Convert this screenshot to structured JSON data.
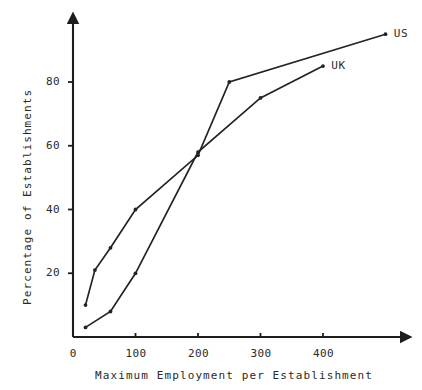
{
  "chart_data": {
    "type": "line",
    "title": "",
    "xlabel": "Maximum Employment per Establishment",
    "ylabel": "Percentage of Establishments",
    "xlim": [
      0,
      500
    ],
    "ylim": [
      0,
      95
    ],
    "grid": false,
    "legend_position": "inline-right-end-of-line",
    "xticks": [
      0,
      100,
      200,
      300,
      400
    ],
    "xtick_labels": [
      "0",
      "100",
      "200",
      "300",
      "400"
    ],
    "yticks": [
      20,
      40,
      60,
      80
    ],
    "ytick_labels": [
      "20",
      "40",
      "60",
      "80"
    ],
    "series": [
      {
        "name": "US",
        "label": "US",
        "x": [
          20,
          35,
          60,
          100,
          200,
          250,
          500
        ],
        "y": [
          10,
          21,
          28,
          40,
          57,
          80,
          95
        ]
      },
      {
        "name": "UK",
        "label": "UK",
        "x": [
          20,
          60,
          100,
          200,
          300,
          400
        ],
        "y": [
          3,
          8,
          20,
          58,
          75,
          85
        ]
      }
    ],
    "annotations": [
      {
        "text": "US",
        "x": 510,
        "y": 95
      },
      {
        "text": "UK",
        "x": 410,
        "y": 85
      }
    ]
  },
  "axes": {
    "y_axis_name": "y-axis",
    "x_axis_name": "x-axis"
  }
}
